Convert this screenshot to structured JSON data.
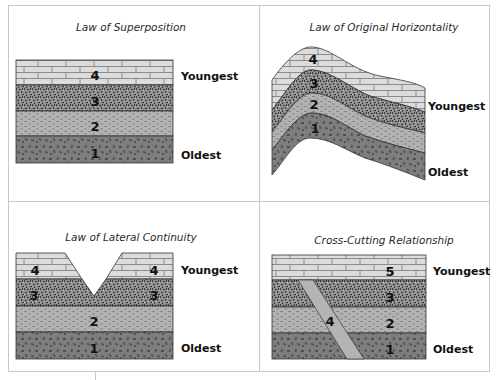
{
  "figure": {
    "panels": [
      {
        "id": "superposition",
        "title": "Law of Superposition",
        "youngest_label": "Youngest",
        "oldest_label": "Oldest",
        "layer_numbers": [
          "4",
          "3",
          "2",
          "1"
        ]
      },
      {
        "id": "original-horizontality",
        "title": "Law of Original Horizontality",
        "youngest_label": "Youngest",
        "oldest_label": "Oldest",
        "layer_numbers": [
          "4",
          "3",
          "2",
          "1"
        ]
      },
      {
        "id": "lateral-continuity",
        "title": "Law of Lateral Continuity",
        "youngest_label": "Youngest",
        "oldest_label": "Oldest",
        "layer_numbers": [
          "4",
          "4",
          "3",
          "3",
          "2",
          "1"
        ]
      },
      {
        "id": "cross-cutting",
        "title": "Cross-Cutting Relationship",
        "youngest_label": "Youngest",
        "oldest_label": "Oldest",
        "layer_numbers": [
          "5",
          "3",
          "2",
          "1"
        ],
        "intrusion_number": "4"
      }
    ],
    "colors": {
      "border": "#c8c8c8",
      "brick_fill": "#dcdcdc",
      "brick_line": "#8c8c8c",
      "speckle_base": "#8a8a8a",
      "speckle_dark": "#3c3c3c",
      "dash_fill": "#b2b2b2",
      "dash_line": "#7a7a7a",
      "fleck_fill": "#7e7e7e",
      "fleck_dark": "#505050",
      "layer_edge": "#333333"
    }
  }
}
